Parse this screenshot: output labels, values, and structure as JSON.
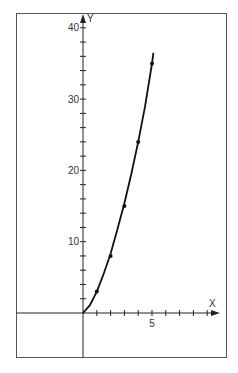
{
  "chart_data": {
    "type": "line",
    "title": "",
    "xlabel": "X",
    "ylabel": "Y",
    "xlim": [
      -5,
      9.5
    ],
    "ylim": [
      -6,
      41
    ],
    "x_ticks": [
      1,
      2,
      3,
      4,
      5,
      6,
      7,
      8,
      9
    ],
    "x_tick_labels": [
      {
        "value": 5,
        "label": "5"
      }
    ],
    "y_ticks": [
      2,
      4,
      6,
      8,
      10,
      12,
      14,
      16,
      18,
      20,
      22,
      24,
      26,
      28,
      30,
      32,
      34,
      36,
      38,
      40
    ],
    "y_tick_labels": [
      {
        "value": 10,
        "label": "10"
      },
      {
        "value": 20,
        "label": "20"
      },
      {
        "value": 30,
        "label": "30"
      },
      {
        "value": 40,
        "label": "40"
      }
    ],
    "grid": false,
    "legend": null,
    "series": [
      {
        "name": "data points",
        "type": "scatter",
        "x": [
          1,
          2,
          3,
          4,
          5
        ],
        "y": [
          3,
          8,
          15,
          24,
          35
        ]
      },
      {
        "name": "fitted curve",
        "type": "line",
        "x": [
          0,
          0.5,
          1,
          1.5,
          2,
          2.5,
          3,
          3.5,
          4,
          4.5,
          5,
          5.1
        ],
        "y": [
          0,
          1.1,
          3,
          5.5,
          8.3,
          11.8,
          15.4,
          19.5,
          24,
          29,
          35,
          36.5
        ]
      }
    ]
  },
  "labels": {
    "x_axis": "X",
    "y_axis": "Y"
  }
}
